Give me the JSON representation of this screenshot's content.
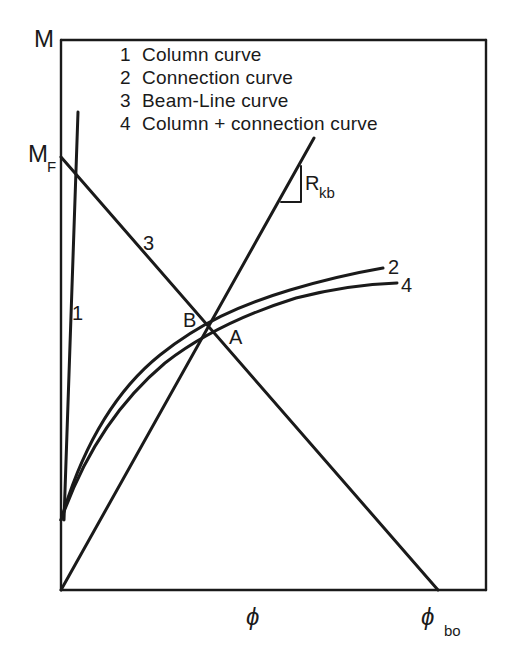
{
  "diagram": {
    "y_axis_label": "M",
    "x_axis_label": "ϕ",
    "mf_label_main": "M",
    "mf_label_sub": "F",
    "phi_bo_main": "ϕ",
    "phi_bo_sub": "bo",
    "rkb_main": "R",
    "rkb_sub": "kb",
    "point_a": "A",
    "point_b": "B",
    "curve_labels": {
      "c1": "1",
      "c2": "2",
      "c3": "3",
      "c4": "4"
    },
    "legend": [
      {
        "num": "1",
        "text": "Column curve"
      },
      {
        "num": "2",
        "text": "Connection curve"
      },
      {
        "num": "3",
        "text": "Beam-Line curve"
      },
      {
        "num": "4",
        "text": "Column + connection curve"
      }
    ],
    "colors": {
      "ink": "#1a1a1a",
      "background": "#ffffff"
    }
  }
}
